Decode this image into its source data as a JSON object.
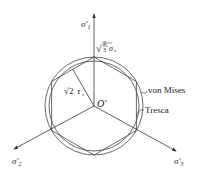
{
  "diagram": {
    "origin_label": "O'",
    "axes": [
      {
        "id": "sigma1",
        "label": "σ'",
        "subscript": "1",
        "direction": "up"
      },
      {
        "id": "sigma2",
        "label": "σ'",
        "subscript": "2",
        "direction": "down-left"
      },
      {
        "id": "sigma3",
        "label": "σ'",
        "subscript": "3",
        "direction": "down-right"
      }
    ],
    "radius_label": {
      "prefix": "√",
      "frac_num": "2",
      "frac_den": "3",
      "symbol": "σ",
      "subscript": "s"
    },
    "apothem_label": {
      "prefix": "√2",
      "symbol": "τ",
      "subscript": "s"
    },
    "curves": [
      {
        "name": "von Mises",
        "shape": "circle"
      },
      {
        "name": "Tresca",
        "shape": "hexagon"
      }
    ],
    "colors": {
      "line": "#333333",
      "text": "#222222",
      "background": "#ffffff"
    }
  }
}
